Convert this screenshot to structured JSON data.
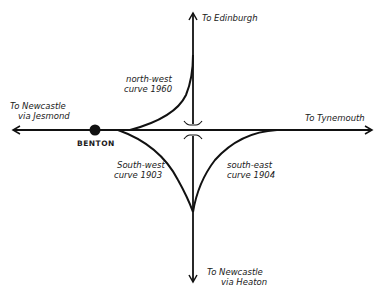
{
  "diagram": {
    "title": "",
    "line_color": "#111111",
    "background": "#ffffff",
    "destinations": {
      "north": "To Edinburgh",
      "east": "To Tynemouth",
      "west_line1": "To Newcastle",
      "west_line2": "via Jesmond",
      "south_line1": "To Newcastle",
      "south_line2": "via Heaton"
    },
    "station": {
      "name": "BENTON"
    },
    "curves": [
      {
        "id": "north-west",
        "line1": "north-west",
        "line2": "curve 1960"
      },
      {
        "id": "south-west",
        "line1": "South-west",
        "line2": "curve 1903"
      },
      {
        "id": "south-east",
        "line1": "south-east",
        "line2": "curve 1904"
      }
    ],
    "crossing": "bridge"
  }
}
